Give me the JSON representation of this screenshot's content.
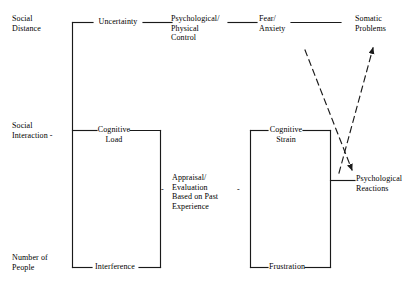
{
  "diagram": {
    "type": "flow-diagram",
    "background_color": "#ffffff",
    "line_color": "#1a1a1a",
    "text_color": "#000000",
    "antecedents": [
      {
        "id": "social-distance",
        "label": "Social\nDistance"
      },
      {
        "id": "social-interaction",
        "label": "Social\nInteraction  -"
      },
      {
        "id": "number-of-people",
        "label": "Number of\nPeople"
      }
    ],
    "mediators": [
      {
        "id": "uncertainty",
        "label": "Uncertainty"
      },
      {
        "id": "cognitive-load",
        "label": "Cognitive\nLoad"
      },
      {
        "id": "interference",
        "label": "Interference"
      }
    ],
    "appraisal": {
      "id": "appraisal-evaluation",
      "label": "Appraisal/\nEvaluation\nBased on Past\nExperience",
      "left_dash": "-",
      "right_dash": "-"
    },
    "outcomes_top": [
      {
        "id": "psychological-physical-control",
        "label": "Psychological/\nPhysical\nControl"
      },
      {
        "id": "fear-anxiety",
        "label": "Fear/\nAnxiety"
      },
      {
        "id": "somatic-problems",
        "label": "Somatic\nProblems"
      }
    ],
    "outcomes_right": [
      {
        "id": "cognitive-strain",
        "label": "Cognitive\nStrain"
      },
      {
        "id": "frustration",
        "label": "Frustration"
      },
      {
        "id": "psychological-reactions",
        "label": "Psychological\nReactions"
      }
    ],
    "dashed_arrows": [
      {
        "id": "arrow-to-somatic-problems",
        "from": "psychological-reactions",
        "to": "somatic-problems",
        "style": "dashed"
      },
      {
        "id": "arrow-to-psychological-reactions",
        "from": "fear-anxiety",
        "to": "psychological-reactions",
        "style": "dashed"
      }
    ]
  }
}
